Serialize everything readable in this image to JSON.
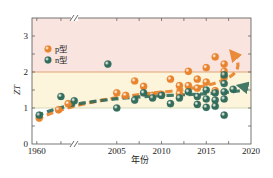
{
  "chart_data": {
    "type": "scatter",
    "title": "",
    "xlabel": "年份",
    "ylabel": "ZT",
    "xlim": [
      1958,
      2020
    ],
    "ylim": [
      0,
      3.5
    ],
    "axis_break": {
      "between": [
        1975,
        2001
      ],
      "symbol": "//"
    },
    "x_ticks": [
      1960,
      2005,
      2010,
      2015,
      2020
    ],
    "x_tick_labels": [
      "1960",
      "2005",
      "2010",
      "2015",
      "2020"
    ],
    "y_ticks": [
      0,
      1,
      2,
      3
    ],
    "y_tick_labels": [
      "0",
      "1",
      "2",
      "3"
    ],
    "zones": [
      {
        "from": 2,
        "to": 3.5,
        "color": "#f9e4df"
      },
      {
        "from": 1,
        "to": 2,
        "color": "#fdf4dc"
      },
      {
        "from": 0,
        "to": 1,
        "color": "#ffffff"
      }
    ],
    "reference_lines": [
      {
        "y": 2,
        "color": "#d9905a"
      },
      {
        "y": 1,
        "color": "#c9d3a8"
      }
    ],
    "legend": {
      "position": "top-left",
      "entries": [
        {
          "label": "p型",
          "color": "#e8822a"
        },
        {
          "label": "n型",
          "color": "#2f6b5a"
        }
      ]
    },
    "series": [
      {
        "name": "p型",
        "color": "#e8822a",
        "points": [
          [
            1961,
            0.72
          ],
          [
            1969,
            0.95
          ],
          [
            1973,
            1.12
          ],
          [
            2005,
            1.42
          ],
          [
            2006,
            1.35
          ],
          [
            2007,
            1.75
          ],
          [
            2008,
            1.6
          ],
          [
            2009,
            1.35
          ],
          [
            2010,
            1.38
          ],
          [
            2011,
            1.8
          ],
          [
            2012,
            1.62
          ],
          [
            2012,
            1.4
          ],
          [
            2013,
            2.02
          ],
          [
            2013,
            1.62
          ],
          [
            2014,
            1.8
          ],
          [
            2014,
            1.55
          ],
          [
            2015,
            2.12
          ],
          [
            2015,
            1.72
          ],
          [
            2016,
            2.42
          ],
          [
            2016,
            1.48
          ],
          [
            2017,
            2.22
          ],
          [
            2017,
            2.02
          ],
          [
            2017,
            1.85
          ]
        ],
        "trend": {
          "from": [
            1960,
            0.68
          ],
          "to": [
            2018,
            2.5
          ]
        }
      },
      {
        "name": "n型",
        "color": "#2f6b5a",
        "points": [
          [
            1961,
            0.8
          ],
          [
            1970,
            1.32
          ],
          [
            1979,
            1.2
          ],
          [
            2004,
            2.22
          ],
          [
            2005,
            1.0
          ],
          [
            2007,
            1.22
          ],
          [
            2008,
            1.42
          ],
          [
            2009,
            1.28
          ],
          [
            2010,
            1.35
          ],
          [
            2011,
            1.12
          ],
          [
            2012,
            1.28
          ],
          [
            2013,
            1.45
          ],
          [
            2014,
            1.1
          ],
          [
            2014,
            1.32
          ],
          [
            2015,
            1.25
          ],
          [
            2015,
            1.5
          ],
          [
            2016,
            1.22
          ],
          [
            2016,
            1.42
          ],
          [
            2017,
            1.25
          ],
          [
            2017,
            1.45
          ],
          [
            2017,
            1.68
          ],
          [
            2017,
            1.92
          ],
          [
            2017,
            0.8
          ],
          [
            2015,
            1.02
          ],
          [
            2016,
            1.05
          ],
          [
            2018,
            1.52
          ]
        ],
        "trend": {
          "from": [
            1960,
            0.78
          ],
          "to": [
            2019,
            1.6
          ]
        }
      }
    ]
  }
}
